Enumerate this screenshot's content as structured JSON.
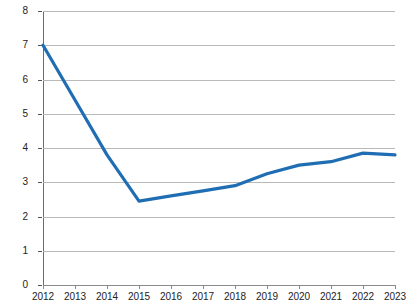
{
  "chart_data": {
    "type": "line",
    "title": "",
    "subtitle": "",
    "xlabel": "",
    "ylabel": "Annual Deficit as a Percent of GDP",
    "categories": [
      "2012",
      "2013",
      "2014",
      "2015",
      "2016",
      "2017",
      "2018",
      "2019",
      "2020",
      "2021",
      "2022",
      "2023"
    ],
    "x": [
      2012,
      2013,
      2014,
      2015,
      2016,
      2017,
      2018,
      2019,
      2020,
      2021,
      2022,
      2023
    ],
    "values": [
      7.0,
      5.4,
      3.8,
      2.45,
      2.6,
      2.75,
      2.9,
      3.25,
      3.5,
      3.6,
      3.85,
      3.8
    ],
    "series": [
      {
        "name": "Annual Deficit as a Percent of GDP",
        "values": [
          7.0,
          5.4,
          3.8,
          2.45,
          2.6,
          2.75,
          2.9,
          3.25,
          3.5,
          3.6,
          3.85,
          3.8
        ]
      }
    ],
    "ylim": [
      0,
      8
    ],
    "xlim": [
      2012,
      2023
    ],
    "ytick_labels": [
      "0",
      "1",
      "2",
      "3",
      "4",
      "5",
      "6",
      "7",
      "8"
    ],
    "ytick_values": [
      0,
      1,
      2,
      3,
      4,
      5,
      6,
      7,
      8
    ],
    "xtick_labels": [
      "2012",
      "2013",
      "2014",
      "2015",
      "2016",
      "2017",
      "2018",
      "2019",
      "2020",
      "2021",
      "2022",
      "2023"
    ],
    "grid": "horizontal",
    "legend": "none",
    "line_color": "#1F6EB4",
    "grid_color": "#b9b9b9",
    "axis_color": "#6b6b6b",
    "annotations": []
  },
  "axes": {
    "y_title": "Annual Deficit as a Percent of GDP"
  }
}
